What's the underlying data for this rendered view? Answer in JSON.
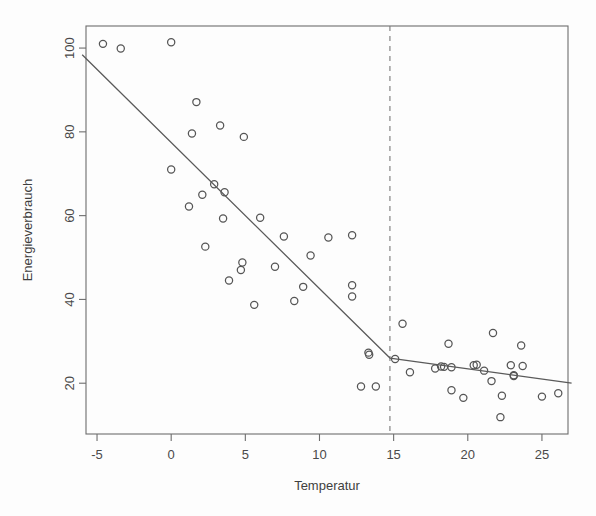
{
  "chart_data": {
    "type": "scatter",
    "title": "",
    "xlabel": "Temperatur",
    "ylabel": "Energieverbrauch",
    "xlim": [
      -6.0,
      27.0
    ],
    "ylim": [
      10.0,
      103.5
    ],
    "xticks": [
      -5,
      0,
      5,
      10,
      15,
      20,
      25
    ],
    "xtick_labels": [
      "-5",
      "0",
      "5",
      "10",
      "15",
      "20",
      "25"
    ],
    "yticks": [
      20,
      40,
      60,
      80,
      100
    ],
    "ytick_labels": [
      "20",
      "40",
      "60",
      "80",
      "100"
    ],
    "grid": false,
    "legend": null,
    "points": [
      [
        -4.6,
        101.0
      ],
      [
        -3.4,
        99.9
      ],
      [
        0.0,
        101.4
      ],
      [
        1.7,
        87.1
      ],
      [
        0.0,
        71.0
      ],
      [
        1.4,
        79.6
      ],
      [
        3.3,
        81.5
      ],
      [
        4.9,
        78.8
      ],
      [
        2.9,
        67.5
      ],
      [
        3.6,
        65.6
      ],
      [
        2.1,
        65.0
      ],
      [
        1.2,
        62.2
      ],
      [
        3.5,
        59.3
      ],
      [
        6.0,
        59.5
      ],
      [
        2.3,
        52.6
      ],
      [
        7.6,
        55.0
      ],
      [
        10.6,
        54.8
      ],
      [
        12.2,
        55.3
      ],
      [
        4.8,
        48.8
      ],
      [
        9.4,
        50.5
      ],
      [
        4.7,
        47.0
      ],
      [
        7.0,
        47.8
      ],
      [
        3.9,
        44.5
      ],
      [
        8.9,
        43.0
      ],
      [
        12.2,
        43.4
      ],
      [
        8.3,
        39.6
      ],
      [
        12.2,
        40.7
      ],
      [
        5.6,
        38.7
      ],
      [
        13.3,
        27.3
      ],
      [
        13.35,
        26.8
      ],
      [
        12.8,
        19.2
      ],
      [
        13.8,
        19.2
      ],
      [
        15.1,
        25.8
      ],
      [
        15.6,
        34.2
      ],
      [
        16.1,
        22.6
      ],
      [
        17.8,
        23.5
      ],
      [
        18.2,
        24.0
      ],
      [
        18.4,
        23.9
      ],
      [
        18.9,
        23.8
      ],
      [
        18.7,
        29.4
      ],
      [
        18.9,
        18.3
      ],
      [
        20.4,
        24.3
      ],
      [
        20.6,
        24.4
      ],
      [
        21.1,
        23.0
      ],
      [
        21.7,
        32.0
      ],
      [
        21.6,
        20.5
      ],
      [
        22.9,
        24.3
      ],
      [
        23.1,
        21.9
      ],
      [
        23.1,
        21.7
      ],
      [
        23.6,
        29.0
      ],
      [
        23.7,
        24.1
      ],
      [
        22.2,
        11.9
      ],
      [
        22.3,
        17.0
      ],
      [
        25.0,
        16.8
      ],
      [
        26.1,
        17.6
      ],
      [
        19.7,
        16.5
      ]
    ],
    "segmented_fit": {
      "description": "piecewise-linear (segmented) regression",
      "breakpoint_x": 14.75,
      "breakpoint_y": 26.0,
      "left_segment": {
        "x_start": -6.0,
        "y_start": 98.4,
        "x_end": 14.75,
        "y_end": 26.0
      },
      "right_segment": {
        "x_start": 14.75,
        "y_start": 26.0,
        "x_end": 27.0,
        "y_end": 20.0
      }
    },
    "breakpoint_marker": {
      "style": "dashed-vertical",
      "x": 14.75
    }
  },
  "geometry": {
    "frame": {
      "left": 86,
      "top": 26,
      "right": 568,
      "bottom": 434
    },
    "x_axis_pixels": {
      "value_min": -6.0,
      "px_min": 82.2,
      "value_max": 27.0,
      "px_max": 571.6
    },
    "y_axis_pixels": {
      "value_min": 10.0,
      "px_min": 425.1,
      "value_max": 103.5,
      "px_max": 33.4
    }
  }
}
